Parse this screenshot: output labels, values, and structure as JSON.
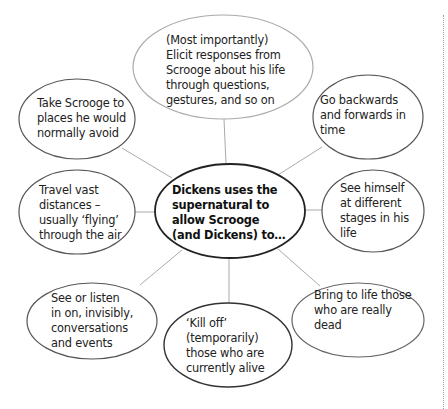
{
  "diagram": {
    "center": {
      "text": "Dickens uses the\nsupernatural to\nallow Scrooge\n(and Dickens) to…"
    },
    "nodes": [
      {
        "id": "elicit",
        "text": "(Most importantly)\nElicit responses from\nScrooge about his life\nthrough questions,\ngestures, and so on"
      },
      {
        "id": "take-places",
        "text": "Take Scrooge to\nplaces he would\nnormally avoid"
      },
      {
        "id": "time-travel",
        "text": "Go backwards\nand forwards in\ntime"
      },
      {
        "id": "travel-distances",
        "text": "Travel vast\ndistances –\nusually ‘flying’\nthrough the air"
      },
      {
        "id": "see-himself",
        "text": "See himself\nat different\nstages in his\nlife"
      },
      {
        "id": "listen-in",
        "text": "See or listen\nin on, invisibly,\nconversations\nand events"
      },
      {
        "id": "kill-off",
        "text": "‘Kill off’\n(temporarily)\nthose who are\ncurrently alive"
      },
      {
        "id": "bring-to-life",
        "text": "Bring to life those\nwho are really\ndead"
      }
    ],
    "colors": {
      "center_border": "#222222",
      "node_border": "#555555",
      "top_node_border": "#aaaaaa",
      "connector": "#aaaaaa",
      "text": "#222222"
    }
  }
}
